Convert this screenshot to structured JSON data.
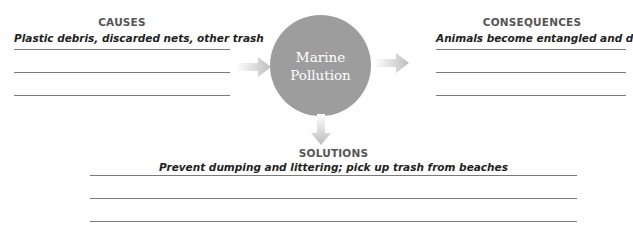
{
  "top_clipped_text": "",
  "center": {
    "line1": "Marine",
    "line2": "Pollution",
    "fill": "#9d9d9d"
  },
  "causes": {
    "heading": "CAUSES",
    "answer": "Plastic debris, discarded nets, other trash",
    "blank_lines": 3
  },
  "consequences": {
    "heading": "CONSEQUENCES",
    "answer": "Animals become entangled and die",
    "blank_lines": 3
  },
  "solutions": {
    "heading": "SOLUTIONS",
    "answer": "Prevent dumping and littering; pick up trash from beaches",
    "blank_lines": 3
  },
  "colors": {
    "arrow": "#c4c4c4",
    "line": "#7a7a7a",
    "heading": "#555555"
  }
}
